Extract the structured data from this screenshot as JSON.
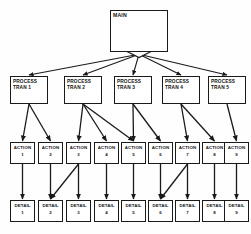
{
  "diagram": {
    "type": "hierarchy-tree",
    "ink_color": "#1a1a1a",
    "paper_color": "#fefefe",
    "levels": [
      "main",
      "process",
      "action",
      "detail"
    ]
  },
  "main": {
    "label": "MAIN",
    "x": 110,
    "y": 10,
    "w": 58,
    "h": 42,
    "connector_icon": "diamond-junction"
  },
  "process_nodes": [
    {
      "line1": "PROCESS",
      "line2": "TRAN 1",
      "x": 10,
      "y": 76,
      "w": 38,
      "h": 28
    },
    {
      "line1": "PROCESS",
      "line2": "TRAN 2",
      "x": 64,
      "y": 76,
      "w": 38,
      "h": 28
    },
    {
      "line1": "PROCESS",
      "line2": "TRAN 3",
      "x": 114,
      "y": 76,
      "w": 38,
      "h": 28
    },
    {
      "line1": "PROCESS",
      "line2": "TRAN 4",
      "x": 162,
      "y": 76,
      "w": 38,
      "h": 28
    },
    {
      "line1": "PROCESS",
      "line2": "TRAN 5",
      "x": 208,
      "y": 76,
      "w": 38,
      "h": 28
    }
  ],
  "action_nodes": [
    {
      "label": "ACTION",
      "num": "1",
      "x": 10,
      "y": 142,
      "w": 25,
      "h": 22
    },
    {
      "label": "ACTION",
      "num": "2",
      "x": 38,
      "y": 142,
      "w": 25,
      "h": 22
    },
    {
      "label": "ACTION",
      "num": "3",
      "x": 66,
      "y": 142,
      "w": 25,
      "h": 22
    },
    {
      "label": "ACTION",
      "num": "4",
      "x": 94,
      "y": 142,
      "w": 25,
      "h": 22
    },
    {
      "label": "ACTION",
      "num": "5",
      "x": 121,
      "y": 142,
      "w": 25,
      "h": 22
    },
    {
      "label": "ACTION",
      "num": "6",
      "x": 148,
      "y": 142,
      "w": 25,
      "h": 22
    },
    {
      "label": "ACTION",
      "num": "7",
      "x": 175,
      "y": 142,
      "w": 25,
      "h": 22
    },
    {
      "label": "ACTION",
      "num": "8",
      "x": 202,
      "y": 142,
      "w": 25,
      "h": 22
    },
    {
      "label": "ACTION",
      "num": "9",
      "x": 224,
      "y": 142,
      "w": 25,
      "h": 22
    }
  ],
  "detail_nodes": [
    {
      "label": "DETAIL",
      "num": "1",
      "x": 10,
      "y": 200,
      "w": 25,
      "h": 22
    },
    {
      "label": "DETAIL",
      "num": "2",
      "x": 38,
      "y": 200,
      "w": 25,
      "h": 22
    },
    {
      "label": "DETAIL",
      "num": "3",
      "x": 66,
      "y": 200,
      "w": 25,
      "h": 22
    },
    {
      "label": "DETAIL",
      "num": "4",
      "x": 94,
      "y": 200,
      "w": 25,
      "h": 22
    },
    {
      "label": "DETAIL",
      "num": "5",
      "x": 121,
      "y": 200,
      "w": 25,
      "h": 22
    },
    {
      "label": "DETAIL",
      "num": "6",
      "x": 148,
      "y": 200,
      "w": 25,
      "h": 22
    },
    {
      "label": "DETAIL",
      "num": "7",
      "x": 175,
      "y": 200,
      "w": 25,
      "h": 22
    },
    {
      "label": "DETAIL",
      "num": "8",
      "x": 202,
      "y": 200,
      "w": 25,
      "h": 22
    },
    {
      "label": "DETAIL",
      "num": "9",
      "x": 224,
      "y": 200,
      "w": 25,
      "h": 22
    }
  ],
  "edges": [
    {
      "from": "main",
      "to": "process-tran-1"
    },
    {
      "from": "main",
      "to": "process-tran-2"
    },
    {
      "from": "main",
      "to": "process-tran-3"
    },
    {
      "from": "main",
      "to": "process-tran-4"
    },
    {
      "from": "main",
      "to": "process-tran-5"
    },
    {
      "from": "process-tran-1",
      "to": "action-1"
    },
    {
      "from": "process-tran-1",
      "to": "action-2"
    },
    {
      "from": "process-tran-2",
      "to": "action-3"
    },
    {
      "from": "process-tran-2",
      "to": "action-4"
    },
    {
      "from": "process-tran-2",
      "to": "action-5"
    },
    {
      "from": "process-tran-3",
      "to": "action-5"
    },
    {
      "from": "process-tran-3",
      "to": "action-6"
    },
    {
      "from": "process-tran-4",
      "to": "action-7"
    },
    {
      "from": "process-tran-4",
      "to": "action-8"
    },
    {
      "from": "process-tran-5",
      "to": "action-9"
    },
    {
      "from": "action-1",
      "to": "detail-1"
    },
    {
      "from": "action-2",
      "to": "detail-2"
    },
    {
      "from": "action-3",
      "to": "detail-2"
    },
    {
      "from": "action-3",
      "to": "detail-3"
    },
    {
      "from": "action-4",
      "to": "detail-4"
    },
    {
      "from": "action-5",
      "to": "detail-5"
    },
    {
      "from": "action-6",
      "to": "detail-6"
    },
    {
      "from": "action-7",
      "to": "detail-6"
    },
    {
      "from": "action-7",
      "to": "detail-7"
    },
    {
      "from": "action-8",
      "to": "detail-8"
    },
    {
      "from": "action-9",
      "to": "detail-9"
    }
  ]
}
